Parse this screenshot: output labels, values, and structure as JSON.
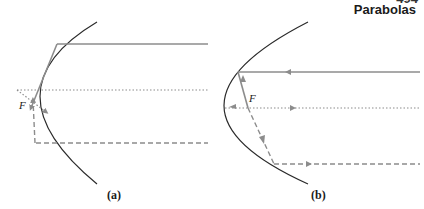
{
  "header": {
    "page_number": "494",
    "title": "Parabolas"
  },
  "figures": [
    {
      "id": "a",
      "caption": "(a)",
      "focus_label": "F"
    },
    {
      "id": "b",
      "caption": "(b)",
      "focus_label": "F"
    }
  ],
  "colors": {
    "curve": "#2a2a2a",
    "ray": "#8c8c8c"
  }
}
